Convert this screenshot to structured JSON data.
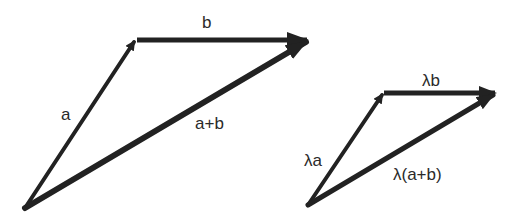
{
  "diagram": {
    "stroke_color": "#222222",
    "background": "#ffffff",
    "left_triangle": {
      "vectors": [
        {
          "id": "a",
          "label": "a",
          "from": [
            25,
            208
          ],
          "to": [
            135,
            40
          ]
        },
        {
          "id": "b",
          "label": "b",
          "from": [
            135,
            40
          ],
          "to": [
            308,
            40
          ]
        },
        {
          "id": "a_plus_b",
          "label": "a+b",
          "from": [
            25,
            208
          ],
          "to": [
            308,
            40
          ]
        }
      ]
    },
    "right_triangle": {
      "vectors": [
        {
          "id": "lambda_a",
          "label": "λa",
          "from": [
            308,
            205
          ],
          "to": [
            383,
            93
          ]
        },
        {
          "id": "lambda_b",
          "label": "λb",
          "from": [
            383,
            93
          ],
          "to": [
            495,
            93
          ]
        },
        {
          "id": "lambda_a_plus_b",
          "label": "λ(a+b)",
          "from": [
            308,
            205
          ],
          "to": [
            495,
            93
          ]
        }
      ]
    }
  }
}
